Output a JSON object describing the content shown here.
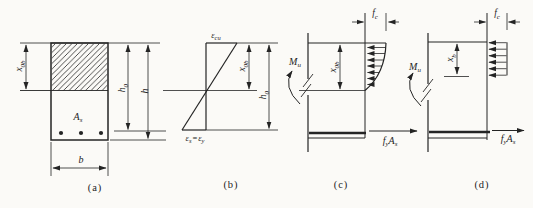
{
  "colors": {
    "ink": "#242424",
    "paper": "#fbfaf7"
  },
  "panels": {
    "a": {
      "caption": "(a)",
      "x0b": {
        "base": "x",
        "sub": "0b"
      },
      "as_label": {
        "base": "A",
        "sub": "s"
      },
      "b_dim": {
        "base": "b"
      },
      "h0": {
        "base": "h",
        "sub": "0"
      },
      "h": {
        "base": "h"
      }
    },
    "b": {
      "caption": "(b)",
      "eps_cu": {
        "base": "ε",
        "sub": "cu"
      },
      "eps_s": {
        "base": "ε",
        "sub": "s"
      },
      "equals": "=",
      "eps_y": {
        "base": "ε",
        "sub": "y"
      },
      "x0b": {
        "base": "x",
        "sub": "0b"
      },
      "h0": {
        "base": "h",
        "sub": "0"
      }
    },
    "c": {
      "caption": "(c)",
      "fc": {
        "base": "f",
        "sub": "c"
      },
      "mu": {
        "base": "M",
        "sub": "u"
      },
      "x0b": {
        "base": "x",
        "sub": "0b"
      },
      "fy": {
        "base": "f",
        "sub": "y"
      },
      "as": {
        "base": "A",
        "sub": "s"
      }
    },
    "d": {
      "caption": "(d)",
      "fc": {
        "base": "f",
        "sub": "c"
      },
      "mu": {
        "base": "M",
        "sub": "u"
      },
      "xb": {
        "base": "x",
        "sub": "b"
      },
      "fy": {
        "base": "f",
        "sub": "y"
      },
      "as": {
        "base": "A",
        "sub": "s"
      }
    }
  }
}
